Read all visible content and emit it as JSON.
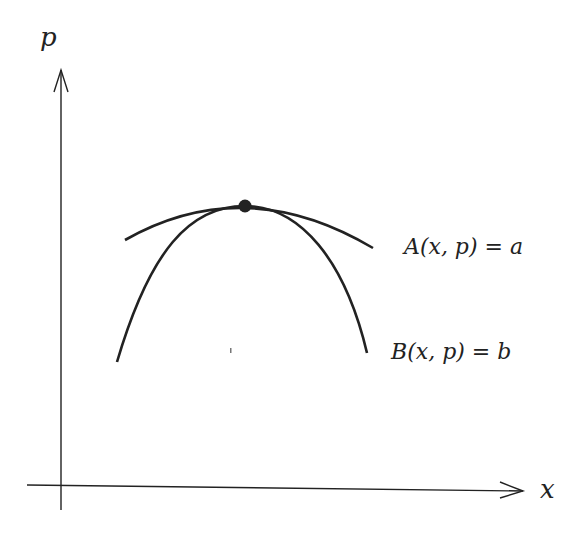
{
  "diagram": {
    "axes": {
      "x_label": "x",
      "y_label": "p"
    },
    "curves": [
      {
        "name": "A",
        "label": "A(x, p) = a"
      },
      {
        "name": "B",
        "label": "B(x, p) = b"
      }
    ],
    "tangent_point": "tangency point of curves A and B",
    "colors": {
      "ink": "#222222",
      "background": "#ffffff"
    }
  }
}
